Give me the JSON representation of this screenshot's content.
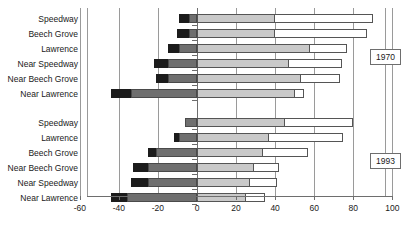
{
  "chart_data": {
    "type": "bar",
    "orientation": "horizontal",
    "title": "",
    "xlabel": "",
    "ylabel": "",
    "xlim": [
      -60,
      100
    ],
    "xticks": [
      -60,
      -40,
      -20,
      0,
      20,
      40,
      60,
      80,
      100
    ],
    "xticklabels": [
      "-60",
      "-40",
      "-20",
      "0",
      "20",
      "40",
      "60",
      "80",
      "100"
    ],
    "grid": true,
    "legend": "none",
    "stacked": true,
    "segment_names": [
      "dark",
      "mid",
      "light",
      "white"
    ],
    "groups": [
      {
        "name": "1970",
        "categories": [
          "Speedway",
          "Beech Grove",
          "Lawrence",
          "Near Speedway",
          "Near Beech Grove",
          "Near Lawrence"
        ],
        "bars": [
          {
            "category": "Speedway",
            "neg_dark": -9,
            "neg_mid": -4,
            "pos_light": 40,
            "pos_white": 90
          },
          {
            "category": "Beech Grove",
            "neg_dark": -10,
            "neg_mid": -4,
            "pos_light": 40,
            "pos_white": 87
          },
          {
            "category": "Lawrence",
            "neg_dark": -15,
            "neg_mid": -9,
            "pos_light": 58,
            "pos_white": 77
          },
          {
            "category": "Near Speedway",
            "neg_dark": -22,
            "neg_mid": -15,
            "pos_light": 47,
            "pos_white": 74
          },
          {
            "category": "Near Beech Grove",
            "neg_dark": -21,
            "neg_mid": -15,
            "pos_light": 53,
            "pos_white": 73
          },
          {
            "category": "Near Lawrence",
            "neg_dark": -44,
            "neg_mid": -34,
            "pos_light": 50,
            "pos_white": 55
          }
        ]
      },
      {
        "name": "1993",
        "categories": [
          "Speedway",
          "Lawrence",
          "Beech Grove",
          "Near Beech Grove",
          "Near Speedway",
          "Near Lawrence"
        ],
        "bars": [
          {
            "category": "Speedway",
            "neg_dark": -6,
            "neg_mid": -6,
            "pos_light": 45,
            "pos_white": 80
          },
          {
            "category": "Lawrence",
            "neg_dark": -12,
            "neg_mid": -9,
            "pos_light": 37,
            "pos_white": 75
          },
          {
            "category": "Beech Grove",
            "neg_dark": -25,
            "neg_mid": -21,
            "pos_light": 34,
            "pos_white": 57
          },
          {
            "category": "Near Beech Grove",
            "neg_dark": -33,
            "neg_mid": -25,
            "pos_light": 29,
            "pos_white": 42
          },
          {
            "category": "Near Speedway",
            "neg_dark": -34,
            "neg_mid": -25,
            "pos_light": 27,
            "pos_white": 41
          },
          {
            "category": "Near Lawrence",
            "neg_dark": -44,
            "neg_mid": -36,
            "pos_light": 25,
            "pos_white": 35
          }
        ]
      }
    ]
  },
  "axis": {
    "ticks": [
      {
        "value": -60,
        "label": "-60"
      },
      {
        "value": -40,
        "label": "-40"
      },
      {
        "value": -20,
        "label": "-20"
      },
      {
        "value": 0,
        "label": "0"
      },
      {
        "value": 20,
        "label": "20"
      },
      {
        "value": 40,
        "label": "40"
      },
      {
        "value": 60,
        "label": "60"
      },
      {
        "value": 80,
        "label": "80"
      },
      {
        "value": 100,
        "label": "100"
      }
    ]
  },
  "colors": {
    "dark": "#1c1c1c",
    "mid": "#6f6f6f",
    "light": "#c9c9c9",
    "white": "#ffffff",
    "axis": "#6e6e6e",
    "grid": "#9a9a9a",
    "text": "#1a1a1a",
    "background": "#ffffff"
  },
  "callouts": [
    {
      "label": "1970"
    },
    {
      "label": "1993"
    }
  ]
}
